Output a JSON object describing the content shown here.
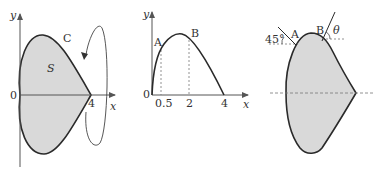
{
  "colors": {
    "stroke": "#2a2a2a",
    "fill": "#d9d9d9",
    "axis": "#555555",
    "dashed": "#777777",
    "background": "#ffffff"
  },
  "panel1": {
    "y_label": "y",
    "x_label": "x",
    "origin_label": "0",
    "x_tick_label": "4",
    "curve_label": "C",
    "region_label": "S",
    "rotation_arrow": "rotation-about-x-axis"
  },
  "panel2": {
    "y_label": "y",
    "x_label": "x",
    "origin_label": "0",
    "x_ticks": [
      "0.5",
      "2",
      "4"
    ],
    "point_a_label": "A",
    "point_b_label": "B"
  },
  "panel3": {
    "point_a_label": "A",
    "point_b_label": "B",
    "angle_a_label": "45°",
    "angle_b_label": "θ"
  }
}
